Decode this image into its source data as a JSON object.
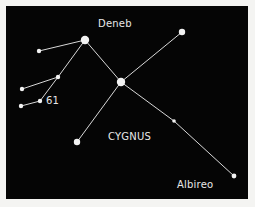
{
  "diagram": {
    "title": "CYGNUS",
    "background_color": "#050505",
    "page_color": "#f4f4f2",
    "line_color": "#d8d8d8",
    "star_color": "#f2f2f2",
    "labels": {
      "deneb": "Deneb",
      "cygnus": "CYGNUS",
      "albireo": "Albireo",
      "star61": "61"
    },
    "stars": [
      {
        "id": "deneb",
        "x": 85,
        "y": 40,
        "r": 4.2
      },
      {
        "id": "upper-left",
        "x": 39,
        "y": 51,
        "r": 2.2
      },
      {
        "id": "left-junction",
        "x": 58,
        "y": 77,
        "r": 2.2
      },
      {
        "id": "left-middle",
        "x": 22,
        "y": 89,
        "r": 2.2
      },
      {
        "id": "star-61",
        "x": 40,
        "y": 101,
        "r": 2.2
      },
      {
        "id": "left-lower",
        "x": 21,
        "y": 106,
        "r": 2.2
      },
      {
        "id": "sadr",
        "x": 121,
        "y": 82,
        "r": 4.2
      },
      {
        "id": "upper-right",
        "x": 182,
        "y": 32,
        "r": 3.2
      },
      {
        "id": "lower-left",
        "x": 77,
        "y": 142,
        "r": 3.2
      },
      {
        "id": "mid-right",
        "x": 174,
        "y": 121,
        "r": 1.8
      },
      {
        "id": "albireo",
        "x": 234,
        "y": 176,
        "r": 2.4
      }
    ],
    "lines": [
      [
        "upper-left",
        "deneb"
      ],
      [
        "deneb",
        "sadr"
      ],
      [
        "deneb",
        "left-junction"
      ],
      [
        "left-junction",
        "left-middle"
      ],
      [
        "left-junction",
        "star-61"
      ],
      [
        "star-61",
        "left-lower"
      ],
      [
        "sadr",
        "upper-right"
      ],
      [
        "sadr",
        "lower-left"
      ],
      [
        "sadr",
        "mid-right"
      ],
      [
        "mid-right",
        "albireo"
      ]
    ]
  }
}
